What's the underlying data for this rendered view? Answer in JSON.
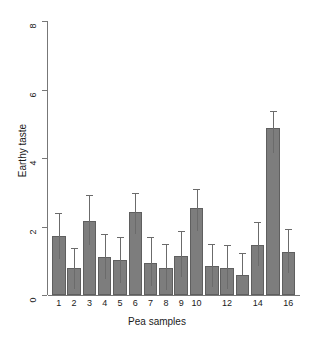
{
  "chart_data": {
    "type": "bar",
    "title": "",
    "subtitle": "",
    "xlabel": "Pea samples",
    "ylabel": "Earthy taste",
    "categories": [
      "1",
      "2",
      "3",
      "4",
      "5",
      "6",
      "7",
      "8",
      "9",
      "10",
      "11",
      "12",
      "13",
      "14",
      "15",
      "16"
    ],
    "tick_labels_shown": [
      "1",
      "2",
      "3",
      "4",
      "5",
      "6",
      "7",
      "8",
      "9",
      "10",
      "",
      "12",
      "",
      "14",
      "",
      "16"
    ],
    "values": [
      1.73,
      0.78,
      2.15,
      1.12,
      1.02,
      2.42,
      0.92,
      0.78,
      1.15,
      2.55,
      0.85,
      0.8,
      0.58,
      1.47,
      4.87,
      1.25
    ],
    "error_upper": [
      2.4,
      1.38,
      2.92,
      1.78,
      1.68,
      2.97,
      1.68,
      1.48,
      1.88,
      3.1,
      1.5,
      1.47,
      1.22,
      2.12,
      5.37,
      1.92
    ],
    "error_lower": [
      1.05,
      0.18,
      1.45,
      0.47,
      0.35,
      1.78,
      0.27,
      0.15,
      0.52,
      1.87,
      0.22,
      0.18,
      0.58,
      0.85,
      4.16,
      0.65
    ],
    "ylim": [
      0,
      8
    ],
    "yticks": [
      0,
      2,
      4,
      6,
      8
    ],
    "ytick_labels": [
      "0",
      "2",
      "4",
      "6",
      "8"
    ],
    "xlim_bars": 16,
    "grid": false,
    "legend": null,
    "colors": {
      "bar_fill": "#7d7d7d",
      "bar_border": "#5f5f5f",
      "axis": "#777777",
      "text": "#1a1a1a",
      "background": "#ffffff",
      "error_bar": "#6b6b6b"
    }
  }
}
